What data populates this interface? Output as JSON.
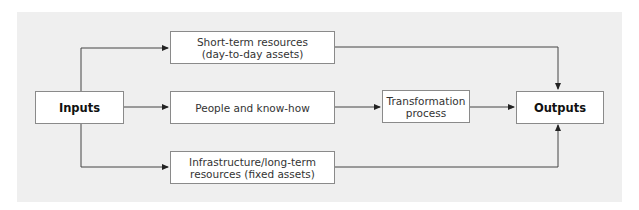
{
  "diagram": {
    "type": "flow",
    "nodes": {
      "inputs": {
        "label": "Inputs"
      },
      "short_term": {
        "label": "Short-term resources\n(day-to-day assets)"
      },
      "people": {
        "label": "People and know-how"
      },
      "infrastructure": {
        "label": "Infrastructure/long-term\nresources (fixed assets)"
      },
      "transformation": {
        "label": "Transformation\nprocess"
      },
      "outputs": {
        "label": "Outputs"
      }
    },
    "edges": [
      {
        "from": "Inputs",
        "to": "Short-term resources (day-to-day assets)"
      },
      {
        "from": "Inputs",
        "to": "People and know-how"
      },
      {
        "from": "Inputs",
        "to": "Infrastructure/long-term resources (fixed assets)"
      },
      {
        "from": "People and know-how",
        "to": "Transformation process"
      },
      {
        "from": "Transformation process",
        "to": "Outputs"
      },
      {
        "from": "Short-term resources (day-to-day assets)",
        "to": "Outputs"
      },
      {
        "from": "Infrastructure/long-term resources (fixed assets)",
        "to": "Outputs"
      }
    ],
    "colors": {
      "panel": "#efefef",
      "box_border": "#8a8a8a",
      "line": "#333333"
    }
  }
}
